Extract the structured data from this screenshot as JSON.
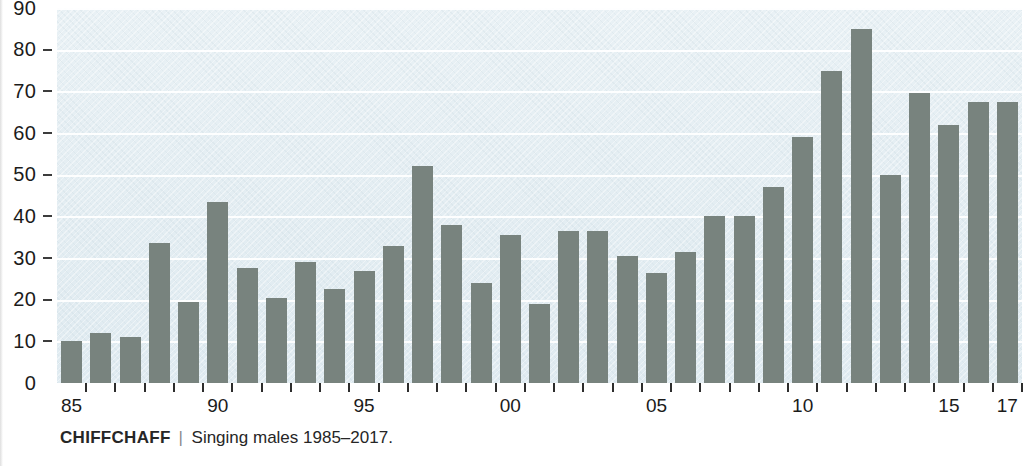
{
  "chart_data": {
    "type": "bar",
    "title": "CHIFFCHAFF",
    "subtitle": "Singing males 1985–2017.",
    "xlabel": "",
    "ylabel": "",
    "ylim": [
      0,
      90
    ],
    "grid": true,
    "legend_position": "none",
    "y_ticks": [
      0,
      10,
      20,
      30,
      40,
      50,
      60,
      70,
      80,
      90
    ],
    "y_tick_labels": [
      "0",
      "10",
      "20",
      "30",
      "40",
      "50",
      "60",
      "70",
      "80",
      "90"
    ],
    "x_tick_labels": [
      "85",
      "90",
      "95",
      "00",
      "05",
      "10",
      "15",
      "17"
    ],
    "x_tick_label_years": [
      1985,
      1990,
      1995,
      2000,
      2005,
      2010,
      2015,
      2017
    ],
    "categories": [
      "1985",
      "1986",
      "1987",
      "1988",
      "1989",
      "1990",
      "1991",
      "1992",
      "1993",
      "1994",
      "1995",
      "1996",
      "1997",
      "1998",
      "1999",
      "2000",
      "2001",
      "2002",
      "2003",
      "2004",
      "2005",
      "2006",
      "2007",
      "2008",
      "2009",
      "2010",
      "2011",
      "2012",
      "2013",
      "2014",
      "2015",
      "2016",
      "2017"
    ],
    "values": [
      10,
      12,
      11,
      33.5,
      19.5,
      43.5,
      27.5,
      20.5,
      29,
      22.5,
      27,
      33,
      52,
      38,
      24,
      35.5,
      19,
      36.5,
      36.5,
      30.5,
      26.5,
      31.5,
      40,
      40,
      47,
      59,
      75,
      85,
      50,
      69.5,
      62,
      67.5,
      67.5
    ],
    "series": [
      {
        "name": "Singing males",
        "values": [
          10,
          12,
          11,
          33.5,
          19.5,
          43.5,
          27.5,
          20.5,
          29,
          22.5,
          27,
          33,
          52,
          38,
          24,
          35.5,
          19,
          36.5,
          36.5,
          30.5,
          26.5,
          31.5,
          40,
          40,
          47,
          59,
          75,
          85,
          50,
          69.5,
          62,
          67.5,
          67.5
        ]
      }
    ]
  },
  "caption": {
    "species": "CHIFFCHAFF",
    "separator": "|",
    "description": "Singing males 1985–2017."
  },
  "colors": {
    "bar": "#78837e",
    "plot_background": "#e4eef3",
    "gridline": "#ffffff",
    "axis_text": "#1b1b1b",
    "tick_mark": "#2d2d2d"
  }
}
